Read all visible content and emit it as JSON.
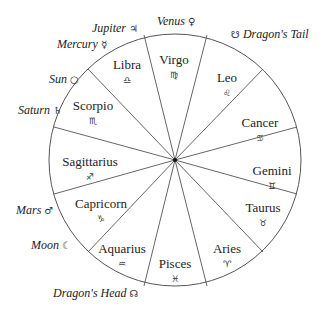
{
  "diagram": {
    "type": "zodiac-wheel",
    "center": [
      175,
      160
    ],
    "radius": 126,
    "colors": {
      "line": "#555555",
      "text": "#222222",
      "background": "#ffffff"
    },
    "spoke_endpoints": [
      [
        144,
        35
      ],
      [
        207,
        35
      ],
      [
        263,
        69
      ],
      [
        297,
        127
      ],
      [
        297,
        194
      ],
      [
        263,
        252
      ],
      [
        207,
        286
      ],
      [
        144,
        286
      ],
      [
        88,
        252
      ],
      [
        54,
        194
      ],
      [
        54,
        127
      ],
      [
        88,
        69
      ]
    ],
    "signs": [
      {
        "name": "Virgo",
        "glyph": "♍",
        "x": 174,
        "y": 64
      },
      {
        "name": "Leo",
        "glyph": "♌",
        "x": 227,
        "y": 82
      },
      {
        "name": "Cancer",
        "glyph": "♋",
        "x": 260,
        "y": 127
      },
      {
        "name": "Gemini",
        "glyph": "♊",
        "x": 272,
        "y": 175
      },
      {
        "name": "Taurus",
        "glyph": "♉",
        "x": 263,
        "y": 212
      },
      {
        "name": "Aries",
        "glyph": "♈",
        "x": 227,
        "y": 253
      },
      {
        "name": "Pisces",
        "glyph": "♓",
        "x": 175,
        "y": 268
      },
      {
        "name": "Aquarius",
        "glyph": "♒",
        "x": 122,
        "y": 253
      },
      {
        "name": "Capricorn",
        "glyph": "♑",
        "x": 101,
        "y": 208
      },
      {
        "name": "Sagittarius",
        "glyph": "♐",
        "x": 90,
        "y": 166
      },
      {
        "name": "Scorpio",
        "glyph": "♏",
        "x": 93,
        "y": 110
      },
      {
        "name": "Libra",
        "glyph": "♎",
        "x": 127,
        "y": 69
      }
    ],
    "planets": [
      {
        "name": "Venus",
        "glyph": "♀",
        "x": 157,
        "y": 25,
        "glyph_first": false
      },
      {
        "name": "Dragon's Tail",
        "glyph": "☋",
        "x": 231,
        "y": 38,
        "glyph_first": true
      },
      {
        "name": "Jupiter",
        "glyph": "♃",
        "x": 92,
        "y": 32,
        "glyph_first": false
      },
      {
        "name": "Mercury",
        "glyph": "☿",
        "x": 57,
        "y": 48,
        "glyph_first": false
      },
      {
        "name": "Sun",
        "glyph": "○",
        "x": 49,
        "y": 83,
        "glyph_first": false
      },
      {
        "name": "Saturn",
        "glyph": "♄",
        "x": 18,
        "y": 114,
        "glyph_first": false
      },
      {
        "name": "Mars",
        "glyph": "♂",
        "x": 16,
        "y": 214,
        "glyph_first": false
      },
      {
        "name": "Moon",
        "glyph": "☾",
        "x": 31,
        "y": 249,
        "glyph_first": false
      },
      {
        "name": "Dragon's Head",
        "glyph": "☊",
        "x": 53,
        "y": 297,
        "glyph_first": false
      }
    ]
  }
}
